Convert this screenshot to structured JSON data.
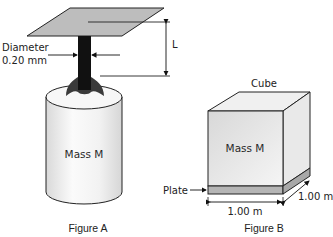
{
  "figure_a": {
    "caption": "Figure A",
    "diameter_label_line1": "Diameter",
    "diameter_label_line2": "0.20 mm",
    "length_label": "L",
    "mass_label": "Mass M"
  },
  "figure_b": {
    "caption": "Figure B",
    "cube_label": "Cube",
    "mass_label": "Mass M",
    "plate_label": "Plate",
    "width_dimension": "1.00 m",
    "depth_dimension": "1.00 m"
  },
  "colors": {
    "plate_gray": "#bdbdbd",
    "wire_black": "#111111",
    "clamp_dark": "#3a3a3a",
    "outline": "#222222"
  }
}
